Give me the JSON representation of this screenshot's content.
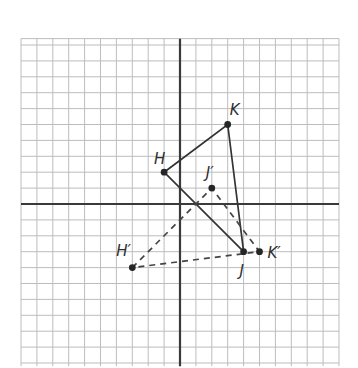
{
  "grid": {
    "origin_px": [
      180,
      204
    ],
    "unit_px": 15.9,
    "x_range": [
      -10,
      10
    ],
    "y_range": [
      -10.2,
      10.4
    ],
    "colors": {
      "grid": "#bdbdbd",
      "axis": "#3a3a3a",
      "ink": "#333333"
    }
  },
  "figures": {
    "original": {
      "style": "solid",
      "vertices": [
        {
          "name": "H",
          "label": "H",
          "x": -1,
          "y": 2,
          "label_dx": -10,
          "label_dy": -8
        },
        {
          "name": "K",
          "label": "K",
          "x": 3,
          "y": 5,
          "label_dx": 2,
          "label_dy": -10
        },
        {
          "name": "J",
          "label": "J",
          "x": 4,
          "y": -3,
          "label_dx": -4,
          "label_dy": 24
        }
      ]
    },
    "image": {
      "style": "dashed",
      "vertices": [
        {
          "name": "H-prime",
          "label": "H′",
          "x": -3,
          "y": -4,
          "label_dx": -16,
          "label_dy": -12
        },
        {
          "name": "J-prime",
          "label": "J′",
          "x": 2,
          "y": 1,
          "label_dx": -6,
          "label_dy": -10
        },
        {
          "name": "K-prime",
          "label": "K′",
          "x": 5,
          "y": -3,
          "label_dx": 8,
          "label_dy": 6
        }
      ]
    }
  },
  "labels": {
    "H": "H",
    "K": "K",
    "J": "J",
    "H_prime": "H′",
    "J_prime": "J′",
    "K_prime": "K′"
  }
}
